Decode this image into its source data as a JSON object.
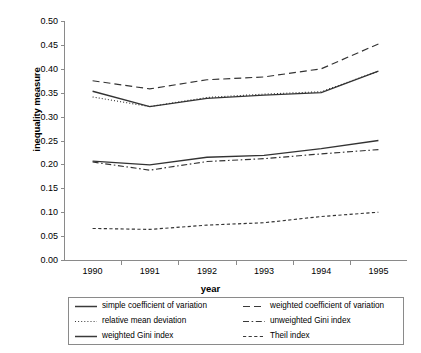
{
  "chart_data": {
    "type": "line",
    "title": "",
    "xlabel": "year",
    "ylabel": "inequality measure",
    "x": [
      1990,
      1991,
      1992,
      1993,
      1994,
      1995
    ],
    "xtick_labels": [
      "1990",
      "1991",
      "1992",
      "1993",
      "1994",
      "1995"
    ],
    "ytick_labels": [
      "0.50",
      "0.45",
      "0.40",
      "0.35",
      "0.30",
      "0.25",
      "0.20",
      "0.15",
      "0.10",
      "0.05",
      "0.00"
    ],
    "ylim": [
      0.0,
      0.5
    ],
    "ytick_step": 0.05,
    "grid": false,
    "legend_position": "bottom",
    "legend_columns": 2,
    "series": [
      {
        "name": "simple coefficient of variation",
        "style": "solid",
        "color": "#333333",
        "values": [
          0.353,
          0.321,
          0.338,
          0.345,
          0.35,
          0.395
        ]
      },
      {
        "name": "weighted coefficient of variation",
        "style": "dashed",
        "color": "#333333",
        "values": [
          0.375,
          0.358,
          0.377,
          0.383,
          0.4,
          0.452
        ]
      },
      {
        "name": "relative mean deviation",
        "style": "dotted",
        "color": "#333333",
        "values": [
          0.341,
          0.321,
          0.34,
          0.347,
          0.352,
          0.395
        ]
      },
      {
        "name": "unweighted Gini index",
        "style": "dash-dot",
        "color": "#333333",
        "values": [
          0.205,
          0.188,
          0.206,
          0.212,
          0.222,
          0.231
        ]
      },
      {
        "name": "weighted Gini index",
        "style": "solid",
        "color": "#333333",
        "values": [
          0.207,
          0.199,
          0.215,
          0.219,
          0.233,
          0.25
        ]
      },
      {
        "name": "Theil index",
        "style": "fine-dashed",
        "color": "#333333",
        "values": [
          0.066,
          0.064,
          0.073,
          0.078,
          0.091,
          0.1
        ]
      }
    ]
  },
  "legend": {
    "entries": [
      {
        "label": "simple coefficient of variation",
        "style": "solid"
      },
      {
        "label": "weighted coefficient of variation",
        "style": "dashed"
      },
      {
        "label": "relative mean deviation",
        "style": "dotted"
      },
      {
        "label": "unweighted Gini index",
        "style": "dash-dot"
      },
      {
        "label": "weighted Gini index",
        "style": "solid"
      },
      {
        "label": "Theil index",
        "style": "fine-dashed"
      }
    ]
  },
  "axes": {
    "axis_color": "#8a8a8a"
  }
}
